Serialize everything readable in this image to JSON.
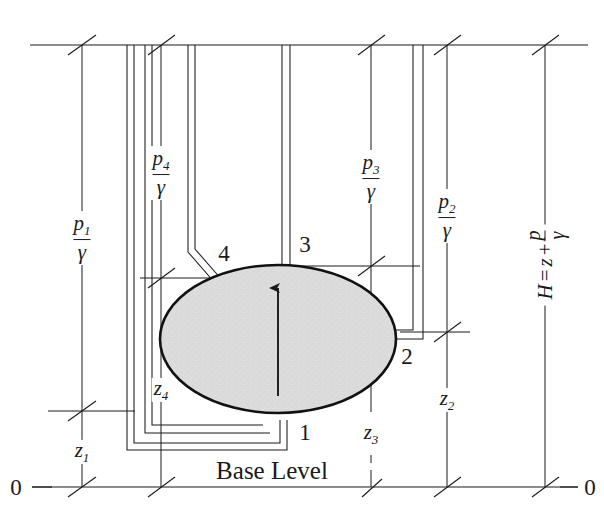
{
  "figure": {
    "type": "engineering-schematic",
    "background_color": "#ffffff",
    "line_color": "#1a1a1a",
    "body_fill_color": "#d9d9d9"
  },
  "levels": {
    "top_line_label": "",
    "base_level_label": "Base Level",
    "datum_left_label": "0",
    "datum_right_label": "0"
  },
  "pressure_heads": [
    {
      "id": "p1",
      "numerator": "p",
      "subscript": "1",
      "denominator": "γ"
    },
    {
      "id": "p4",
      "numerator": "p",
      "subscript": "4",
      "denominator": "γ"
    },
    {
      "id": "p3",
      "numerator": "p",
      "subscript": "3",
      "denominator": "γ"
    },
    {
      "id": "p2",
      "numerator": "p",
      "subscript": "2",
      "denominator": "γ"
    }
  ],
  "elevation_heads": [
    {
      "id": "z1",
      "symbol": "z",
      "subscript": "1"
    },
    {
      "id": "z4",
      "symbol": "z",
      "subscript": "4"
    },
    {
      "id": "z3",
      "symbol": "z",
      "subscript": "3"
    },
    {
      "id": "z2",
      "symbol": "z",
      "subscript": "2"
    }
  ],
  "point_labels": [
    {
      "id": "pt1",
      "label": "1"
    },
    {
      "id": "pt2",
      "label": "2"
    },
    {
      "id": "pt3",
      "label": "3"
    },
    {
      "id": "pt4",
      "label": "4"
    }
  ],
  "total_head": {
    "symbol": "H",
    "equals": "=",
    "z_term": "z",
    "plus": "+",
    "frac_num": "p",
    "frac_den": "γ",
    "full_text": "H = z + p/γ"
  },
  "body": {
    "name": "submerged-body",
    "shape": "ellipse",
    "center_x": 278,
    "center_y": 339,
    "radius_x": 118,
    "radius_y": 74,
    "fill": "#d9d9d9",
    "stroke": "#111111"
  },
  "buoyancy_arrow": {
    "name": "buoyancy-arrow",
    "direction": "up",
    "from_y": 395,
    "to_y": 278,
    "x": 278
  }
}
